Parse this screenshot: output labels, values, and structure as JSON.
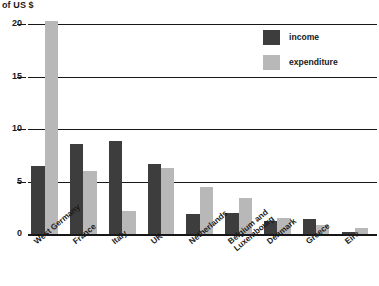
{
  "chart_data": {
    "type": "bar",
    "title": "",
    "ylabel": "of US $",
    "xlabel": "",
    "ylim": [
      0,
      20
    ],
    "yticks": [
      0,
      5,
      10,
      15,
      20
    ],
    "ytick_labels": [
      "0",
      "5",
      "10",
      "15",
      "20"
    ],
    "grid": true,
    "legend_position": "top-right",
    "categories": [
      "West Germany",
      "France",
      "Italy",
      "UK",
      "Netherlands",
      "Belgium and Luxembourg",
      "Denmark",
      "Greece",
      "Eire"
    ],
    "category_lines": [
      [
        "West Germany"
      ],
      [
        "France"
      ],
      [
        "Italy"
      ],
      [
        "UK"
      ],
      [
        "Netherlands"
      ],
      [
        "Belgium and",
        "Luxembourg"
      ],
      [
        "Denmark"
      ],
      [
        "Greece"
      ],
      [
        "Eire"
      ]
    ],
    "series": [
      {
        "name": "income",
        "color": "#3d3d3d",
        "values": [
          6.5,
          8.6,
          8.9,
          6.7,
          1.9,
          2.0,
          1.2,
          1.4,
          0.2
        ]
      },
      {
        "name": "expenditure",
        "color": "#b8b8b8",
        "values": [
          20.3,
          6.0,
          2.2,
          6.3,
          4.5,
          3.4,
          1.5,
          0.9,
          0.6
        ]
      }
    ]
  },
  "legend": {
    "items": [
      {
        "label": "income",
        "color": "#3d3d3d"
      },
      {
        "label": "expenditure",
        "color": "#b8b8b8"
      }
    ]
  },
  "axis": {
    "title": "of US $"
  }
}
